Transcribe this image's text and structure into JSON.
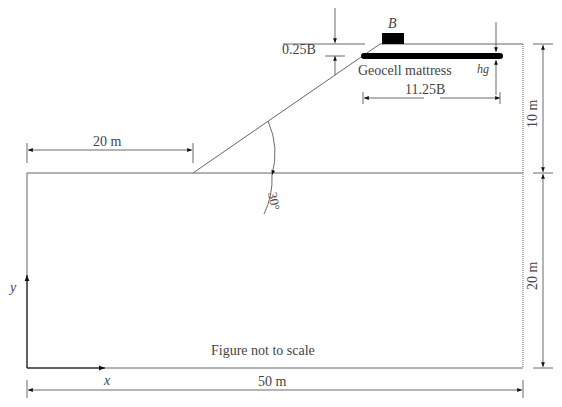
{
  "figure": {
    "caption": "Figure not to scale",
    "labels": {
      "footing": "B",
      "embedment": "0.25B",
      "mattress": "Geocell mattress",
      "mattress_height": "hg",
      "mattress_width": "11.25B",
      "crest_offset": "20 m",
      "slope_height": "10 m",
      "foundation_depth": "20 m",
      "total_width": "50 m",
      "slope_angle": "30°",
      "x_axis": "x",
      "y_axis": "y"
    },
    "colors": {
      "line": "#555555",
      "fill": "#000000",
      "text": "#444444"
    }
  }
}
